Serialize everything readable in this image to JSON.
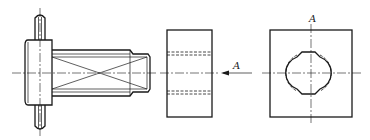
{
  "drawing": {
    "description": "Engineering drawing: shaft with flange and pin, bushing block side view, and view A showing shaped bore",
    "views": [
      {
        "name": "shaft-assembly-front-view"
      },
      {
        "name": "block-side-view"
      },
      {
        "name": "view-A"
      }
    ],
    "labels": {
      "arrow_label": "A",
      "view_label": "A"
    },
    "colors": {
      "line": "#1a1a1a",
      "background": "#ffffff"
    }
  }
}
